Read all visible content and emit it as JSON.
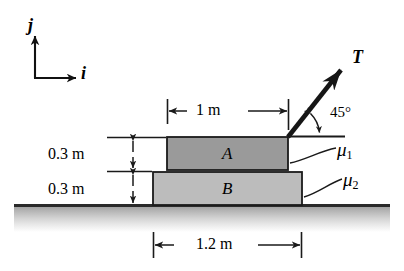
{
  "figure": {
    "background_color": "#ffffff"
  },
  "axes": {
    "j_label": "j",
    "i_label": "i",
    "origin_x": 35,
    "origin_y": 78
  },
  "force": {
    "label": "T",
    "angle_label": "45°",
    "angle_degrees": 45,
    "origin_x": 288,
    "origin_y": 137,
    "tip_x": 347,
    "tip_y": 64
  },
  "blocks": [
    {
      "id": "A",
      "label": "A",
      "fill": "#9a9a9a",
      "stroke": "#1a1a1a",
      "x": 167,
      "y": 137,
      "width": 121,
      "height": 33
    },
    {
      "id": "B",
      "label": "B",
      "fill": "#bcbcbc",
      "stroke": "#1a1a1a",
      "x": 153,
      "y": 172,
      "width": 149,
      "height": 33
    }
  ],
  "friction": {
    "upper_label": "μ",
    "upper_subscript": "1",
    "lower_label": "μ",
    "lower_subscript": "2"
  },
  "dimensions": {
    "top_width": "1 m",
    "upper_height": "0.3 m",
    "lower_height": "0.3 m",
    "base_width": "1.2 m"
  },
  "ground": {
    "line_y": 205,
    "line_x_start": 14,
    "line_x_end": 390,
    "shadow_color": "#9f9f9f"
  }
}
